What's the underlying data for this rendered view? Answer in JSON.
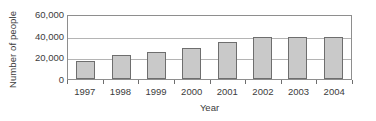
{
  "chart_data": {
    "type": "bar",
    "title": "",
    "xlabel": "Year",
    "ylabel": "Number of people",
    "categories": [
      "1997",
      "1998",
      "1999",
      "2000",
      "2001",
      "2002",
      "2003",
      "2004"
    ],
    "values": [
      17000,
      22000,
      25000,
      29000,
      34000,
      39000,
      39000,
      39000
    ],
    "ylim": [
      0,
      60000
    ],
    "yticks": [
      0,
      20000,
      40000,
      60000
    ],
    "ytick_labels": [
      "0",
      "20,000",
      "40,000",
      "60,000"
    ],
    "grid": "horizontal",
    "legend": "none",
    "series": [
      {
        "name": "Number of people",
        "values": [
          17000,
          22000,
          25000,
          29000,
          34000,
          39000,
          39000,
          39000
        ]
      }
    ],
    "colors": {
      "bar_fill": "#c9c9c9",
      "bar_stroke": "#6e6e6e",
      "gridline": "#b4b4b4",
      "axis": "#8e8e8e",
      "text": "#3c3c3c",
      "background": "#ffffff"
    }
  }
}
